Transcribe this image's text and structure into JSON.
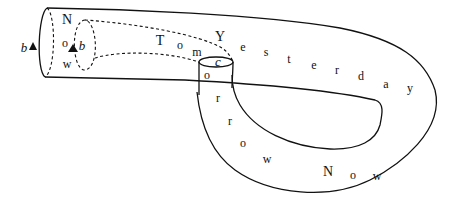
{
  "diagram": {
    "stroke_color": "#111111",
    "background": "#ffffff",
    "labels": {
      "outer_loop_b": "b",
      "inner_loop_b": "b",
      "throat_c": "c"
    },
    "paths": {
      "now_vertical": [
        {
          "ch": "N",
          "x": 67,
          "y": 20
        },
        {
          "ch": "o",
          "x": 65,
          "y": 43
        },
        {
          "ch": "w",
          "x": 67,
          "y": 64
        }
      ],
      "tom_yesterday": [
        {
          "ch": "T",
          "x": 160,
          "y": 41
        },
        {
          "ch": "o",
          "x": 180,
          "y": 45
        },
        {
          "ch": "m",
          "x": 197,
          "y": 52
        },
        {
          "ch": "Y",
          "x": 220,
          "y": 37
        },
        {
          "ch": "e",
          "x": 243,
          "y": 47
        },
        {
          "ch": "s",
          "x": 266,
          "y": 52
        },
        {
          "ch": "t",
          "x": 289,
          "y": 59
        },
        {
          "ch": "e",
          "x": 314,
          "y": 65
        },
        {
          "ch": "r",
          "x": 337,
          "y": 70
        },
        {
          "ch": "d",
          "x": 361,
          "y": 76
        },
        {
          "ch": "a",
          "x": 386,
          "y": 84
        },
        {
          "ch": "y",
          "x": 410,
          "y": 88
        }
      ],
      "tomorrow_now": [
        {
          "ch": "o",
          "x": 207,
          "y": 75
        },
        {
          "ch": "r",
          "x": 218,
          "y": 98
        },
        {
          "ch": "r",
          "x": 230,
          "y": 121
        },
        {
          "ch": "o",
          "x": 243,
          "y": 143
        },
        {
          "ch": "w",
          "x": 267,
          "y": 159
        },
        {
          "ch": "N",
          "x": 328,
          "y": 172
        },
        {
          "ch": "o",
          "x": 353,
          "y": 175
        },
        {
          "ch": "w",
          "x": 377,
          "y": 176
        }
      ]
    }
  }
}
